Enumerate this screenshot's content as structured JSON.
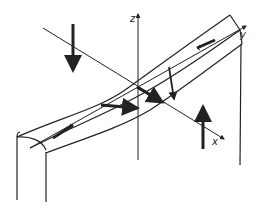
{
  "figure": {
    "type": "3D coordinate diagram of a twisted strip/beam under load",
    "axes": {
      "x_label": "x",
      "y_label": "y",
      "z_label": "z"
    },
    "colors": {
      "line": "#222222",
      "background": "#ffffff"
    }
  }
}
